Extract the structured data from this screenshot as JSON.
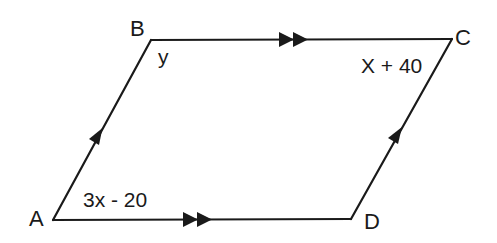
{
  "diagram": {
    "type": "parallelogram",
    "line_color": "#1a1a1a",
    "vertices": [
      {
        "name": "A",
        "x": 53,
        "y": 220
      },
      {
        "name": "B",
        "x": 151,
        "y": 40
      },
      {
        "name": "C",
        "x": 452,
        "y": 39
      },
      {
        "name": "D",
        "x": 351,
        "y": 219
      }
    ],
    "vertex_labels": {
      "A": "A",
      "B": "B",
      "C": "C",
      "D": "D"
    },
    "angle_labels": {
      "A": "3x - 20",
      "B": "y",
      "C": "X + 40"
    },
    "parallel_marks": {
      "AB": "single-arrow",
      "DC": "single-arrow",
      "BC": "double-arrow",
      "AD": "double-arrow"
    }
  }
}
